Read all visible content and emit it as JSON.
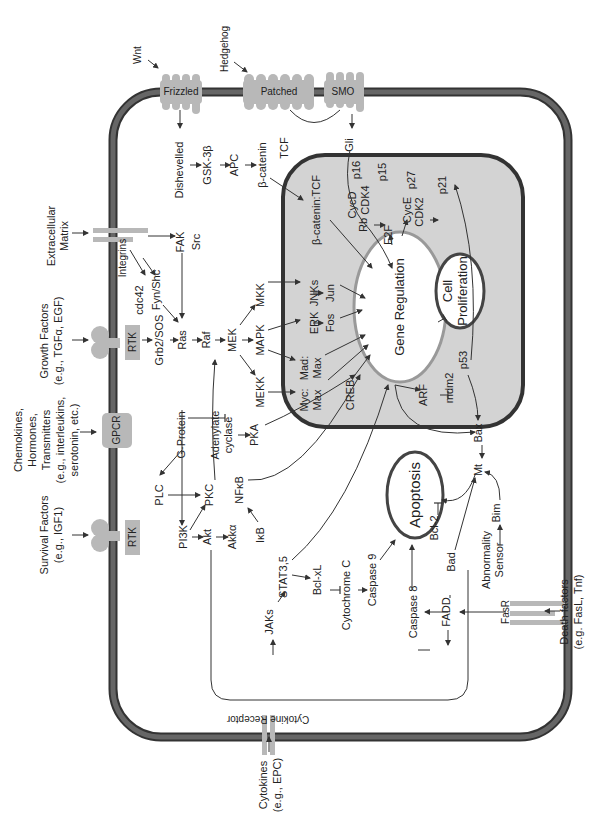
{
  "diagram": {
    "colors": {
      "membrane": "#555555",
      "membrane_edge": "#333333",
      "nucleus_fill": "#d3d3d3",
      "receptor": "#b8b8b8",
      "oval_fill": "#ffffff",
      "background": "#ffffff"
    },
    "external_signals": {
      "wnt": "Wnt",
      "hedgehog": "Hedgehog",
      "ecm_1": "Extracellular",
      "ecm_2": "Matrix",
      "growth_1": "Growth Factors",
      "growth_2": "(e.g., TGFα, EGF)",
      "chemo_1": "Chemokines,",
      "chemo_2": "Hormones,",
      "chemo_3": "Transmitters",
      "chemo_4": "(e.g., interleukins,",
      "chemo_5": "serotonin, etc.)",
      "survival_1": "Survival Factors",
      "survival_2": "(e.g., IGF1)",
      "cytokines_1": "Cytokines",
      "cytokines_2": "(e.g., EPC)",
      "death_1": "Death factors",
      "death_2": "(e.g. FasL, Tnf)"
    },
    "receptors": {
      "frizzled": "Frizzled",
      "patched": "Patched",
      "smo": "SMO",
      "integrins": "Integrins",
      "rtk_growth": "RTK",
      "gpcr": "GPCR",
      "rtk_survival": "RTK",
      "cytokine_receptor": "Cytokine Receptor",
      "fasr": "FasR"
    },
    "cytoplasm": {
      "dishevelled": "Dishevelled",
      "gsk3b": "GSK-3β",
      "apc": "APC",
      "bcatenin": "β-catenin",
      "tcf": "TCF",
      "gli": "Gli",
      "fak": "FAK",
      "src": "Src",
      "fynshc": "Fyn/Shc",
      "cdc42": "cdc42",
      "grb2sos": "Grb2/SOS",
      "ras": "Ras",
      "raf": "Raf",
      "mek": "MEK",
      "mkk": "MKK",
      "mapk": "MAPK",
      "mekk": "MEKK",
      "gprotein": "G-Protein",
      "adenylate_1": "Adenylate",
      "adenylate_2": "cyclase",
      "pka": "PKA",
      "plc": "PLC",
      "pkc": "PKC",
      "pi3k": "PI3K",
      "akt": "Akt",
      "akka": "Akkα",
      "nfkb": "NFκB",
      "ikb": "IκB",
      "jaks": "JAKs",
      "stat": "STAT3,5",
      "bclxl": "Bcl-xL",
      "cytc": "Cytochrome C",
      "casp9": "Caspase 9",
      "casp8": "Caspase 8",
      "fadd": "FADD",
      "bad": "Bad",
      "bcl2": "Bcl-2",
      "abn_1": "Abnormality",
      "abn_2": "Sensor",
      "bim": "Bim",
      "mt": "Mt",
      "bax": "Bax"
    },
    "nucleus": {
      "bcat_tcf": "β-catenin:TCF",
      "cycd": "CycD",
      "cdk4": "CDK4",
      "p16": "p16",
      "p15": "p15",
      "rb": "Rb",
      "e2f": "E2F",
      "cyce": "CycE",
      "cdk2": "CDK2",
      "p27": "p27",
      "p21": "p21",
      "jnks": "JNKs",
      "jun": "Jun",
      "erk": "ERK",
      "fos": "Fos",
      "myc": "Myc:",
      "mad": "Mad:",
      "max1": "Max",
      "max2": "Max",
      "creb": "CREB",
      "arf": "ARF",
      "mdm2": "mdm2",
      "p53": "p53"
    },
    "outcomes": {
      "gene_regulation": "Gene Regulation",
      "cell_1": "Cell",
      "cell_2": "Proliferation",
      "apoptosis": "Apoptosis"
    }
  }
}
